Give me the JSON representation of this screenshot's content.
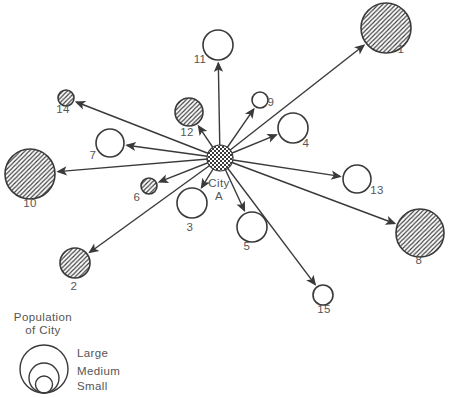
{
  "figure": {
    "width": 449,
    "height": 398,
    "background": "#ffffff",
    "ink_color": "#3a3a3a",
    "text_color": "#555555"
  },
  "diagram": {
    "center": {
      "label_line1": "City",
      "label_line2": "A",
      "x": 220,
      "y": 158,
      "r": 13,
      "fill": "checkerboard",
      "label_x": 219,
      "label_y1": 187,
      "label_y2": 200
    },
    "nodes": [
      {
        "id": "1",
        "x": 386,
        "y": 28,
        "r": 25,
        "size": "large",
        "hatched": true,
        "label_x": 401,
        "label_y": 53
      },
      {
        "id": "2",
        "x": 75,
        "y": 263,
        "r": 15,
        "size": "medium",
        "hatched": true,
        "label_x": 74,
        "label_y": 290
      },
      {
        "id": "3",
        "x": 192,
        "y": 203,
        "r": 15,
        "size": "medium",
        "hatched": false,
        "label_x": 190,
        "label_y": 231
      },
      {
        "id": "4",
        "x": 293,
        "y": 128,
        "r": 15,
        "size": "medium",
        "hatched": false,
        "label_x": 306,
        "label_y": 147
      },
      {
        "id": "5",
        "x": 252,
        "y": 227,
        "r": 15,
        "size": "medium",
        "hatched": false,
        "label_x": 247,
        "label_y": 250
      },
      {
        "id": "6",
        "x": 149,
        "y": 186,
        "r": 8,
        "size": "small",
        "hatched": true,
        "label_x": 137,
        "label_y": 201
      },
      {
        "id": "7",
        "x": 110,
        "y": 143,
        "r": 14,
        "size": "medium",
        "hatched": false,
        "label_x": 93,
        "label_y": 159
      },
      {
        "id": "8",
        "x": 420,
        "y": 233,
        "r": 24,
        "size": "large",
        "hatched": true,
        "label_x": 419,
        "label_y": 264
      },
      {
        "id": "9",
        "x": 260,
        "y": 100,
        "r": 8,
        "size": "small",
        "hatched": false,
        "label_x": 271,
        "label_y": 106
      },
      {
        "id": "10",
        "x": 30,
        "y": 174,
        "r": 25,
        "size": "large",
        "hatched": true,
        "label_x": 30,
        "label_y": 207
      },
      {
        "id": "11",
        "x": 218,
        "y": 45,
        "r": 15,
        "size": "medium",
        "hatched": false,
        "label_x": 200,
        "label_y": 63
      },
      {
        "id": "12",
        "x": 189,
        "y": 112,
        "r": 14,
        "size": "medium",
        "hatched": true,
        "label_x": 187,
        "label_y": 136
      },
      {
        "id": "13",
        "x": 357,
        "y": 179,
        "r": 14,
        "size": "medium",
        "hatched": false,
        "label_x": 377,
        "label_y": 194
      },
      {
        "id": "14",
        "x": 66,
        "y": 98,
        "r": 8,
        "size": "small",
        "hatched": true,
        "label_x": 63,
        "label_y": 113
      },
      {
        "id": "15",
        "x": 323,
        "y": 295,
        "r": 10,
        "size": "small",
        "hatched": false,
        "label_x": 324,
        "label_y": 313
      }
    ]
  },
  "legend": {
    "title_line1": "Population",
    "title_line2": "of City",
    "title_x": 43,
    "title_y1": 321,
    "title_y2": 334,
    "circles_cx": 44,
    "circles_bottom_y": 393,
    "labels_x": 77,
    "items": [
      {
        "label": "Large",
        "r": 24,
        "label_y": 357
      },
      {
        "label": "Medium",
        "r": 15,
        "label_y": 375
      },
      {
        "label": "Small",
        "r": 8.5,
        "label_y": 390
      }
    ]
  }
}
